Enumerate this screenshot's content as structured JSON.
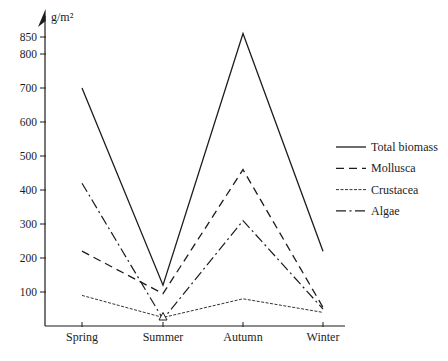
{
  "figure": {
    "background": "#ffffff",
    "ink_color": "#1c1c1c"
  },
  "chart_data": {
    "type": "line",
    "title": "",
    "xlabel": "",
    "ylabel": "g/m²",
    "categories": [
      "Spring",
      "Summer",
      "Autumn",
      "Winter"
    ],
    "series": [
      {
        "name": "Total biomass",
        "style": "solid",
        "values": [
          700,
          120,
          860,
          220
        ]
      },
      {
        "name": "Mollusca",
        "style": "dashed",
        "values": [
          220,
          95,
          460,
          55
        ]
      },
      {
        "name": "Crustacea",
        "style": "fine-dashed",
        "values": [
          90,
          25,
          80,
          40
        ]
      },
      {
        "name": "Algae",
        "style": "dash-dot",
        "values": [
          420,
          20,
          310,
          50
        ]
      }
    ],
    "ylim": [
      0,
      880
    ],
    "yticks": [
      100,
      200,
      300,
      400,
      500,
      600,
      700,
      800,
      850
    ],
    "grid": false,
    "legend_position": "right-center",
    "marker": {
      "series": "Crustacea",
      "category": "Summer",
      "shape": "open-triangle"
    }
  }
}
